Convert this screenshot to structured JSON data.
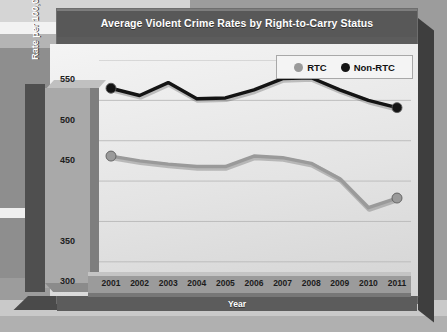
{
  "chart_data": {
    "type": "line",
    "title": "Average Violent Crime Rates by Right-to-Carry Status",
    "xlabel": "Year",
    "ylabel": "Rate per 100,000 population",
    "categories": [
      "2001",
      "2002",
      "2003",
      "2004",
      "2005",
      "2006",
      "2007",
      "2008",
      "2009",
      "2010",
      "2011"
    ],
    "x": [
      2001,
      2002,
      2003,
      2004,
      2005,
      2006,
      2007,
      2008,
      2009,
      2010,
      2011
    ],
    "ylim": [
      300,
      575
    ],
    "ytick_labels": [
      "550",
      "500",
      "450",
      "350",
      "300"
    ],
    "ytick_values": [
      550,
      500,
      450,
      350,
      300
    ],
    "gridlines": [
      325,
      375,
      425,
      475,
      525,
      575
    ],
    "grid": true,
    "legend_position": "top-right",
    "series": [
      {
        "name": "RTC",
        "color": "#9a9a9a",
        "marker": "circle",
        "values": [
          456,
          450,
          446,
          443,
          443,
          456,
          454,
          447,
          428,
          392,
          404
        ]
      },
      {
        "name": "Non-RTC",
        "color": "#141414",
        "marker": "circle",
        "values": [
          540,
          531,
          547,
          527,
          528,
          538,
          552,
          553,
          538,
          525,
          516
        ]
      }
    ]
  },
  "legend": {
    "items": [
      {
        "label": "RTC",
        "color": "#9a9a9a"
      },
      {
        "label": "Non-RTC",
        "color": "#141414"
      }
    ]
  },
  "colors": {
    "title_bar": "#585858",
    "panel": "#e9e9e9",
    "axis_block": "#a9a9a9",
    "rtc": "#9a9a9a",
    "non_rtc": "#141414"
  }
}
